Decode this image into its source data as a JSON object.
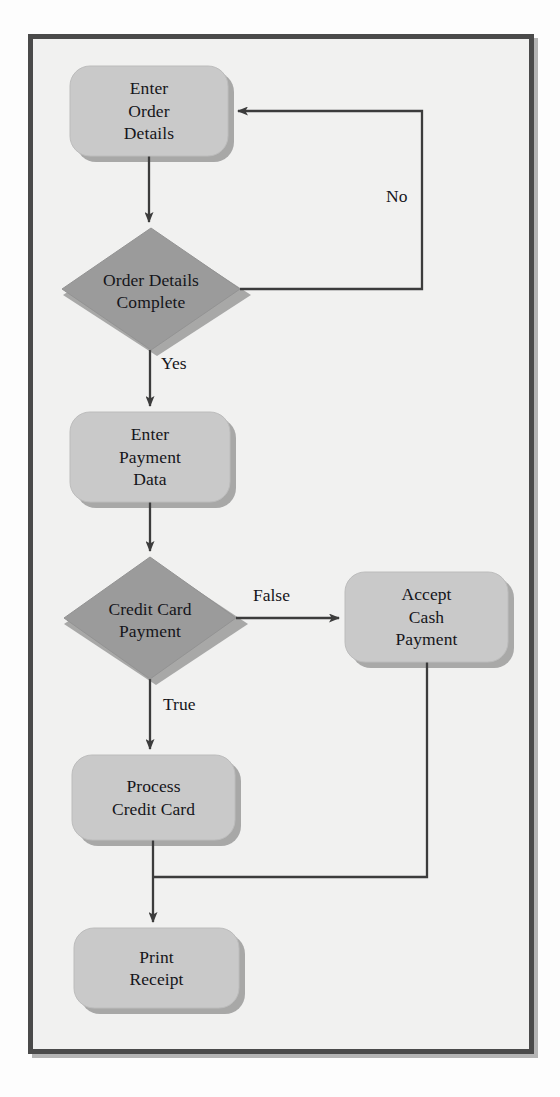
{
  "diagram": {
    "background_color": "#f1f1f0",
    "frame_border_color": "#4a4a4a",
    "process_fill": "#c9c9c9",
    "decision_fill": "#9b9b9b",
    "shadow_color": "#7c7c7c",
    "line_color": "#3c3c3c",
    "text_color": "#15151a"
  },
  "nodes": [
    {
      "id": "enter-order-details",
      "type": "process",
      "label": "Enter\nOrder\nDetails",
      "x": 70,
      "y": 66,
      "w": 158,
      "h": 90
    },
    {
      "id": "order-details-complete",
      "type": "decision",
      "label": "Order Details\nComplete",
      "x": 62,
      "y": 228,
      "w": 178,
      "h": 122
    },
    {
      "id": "enter-payment-data",
      "type": "process",
      "label": "Enter\nPayment\nData",
      "x": 70,
      "y": 412,
      "w": 160,
      "h": 90
    },
    {
      "id": "credit-card-payment",
      "type": "decision",
      "label": "Credit Card\nPayment",
      "x": 64,
      "y": 557,
      "w": 172,
      "h": 122
    },
    {
      "id": "accept-cash-payment",
      "type": "process",
      "label": "Accept\nCash\nPayment",
      "x": 345,
      "y": 572,
      "w": 163,
      "h": 90
    },
    {
      "id": "process-credit-card",
      "type": "process",
      "label": "Process\nCredit Card",
      "x": 72,
      "y": 755,
      "w": 163,
      "h": 85
    },
    {
      "id": "print-receipt",
      "type": "process",
      "label": "Print\nReceipt",
      "x": 74,
      "y": 928,
      "w": 165,
      "h": 80
    }
  ],
  "edge_labels": [
    {
      "id": "no-label",
      "text": "No",
      "x": 386,
      "y": 188
    },
    {
      "id": "yes-label",
      "text": "Yes",
      "x": 161,
      "y": 355
    },
    {
      "id": "false-label",
      "text": "False",
      "x": 253,
      "y": 587
    },
    {
      "id": "true-label",
      "text": "True",
      "x": 163,
      "y": 696
    }
  ],
  "edges": [
    {
      "id": "edge-order-to-decision",
      "from": "enter-order-details",
      "to": "order-details-complete",
      "label": ""
    },
    {
      "id": "edge-decision-no-loopback",
      "from": "order-details-complete",
      "to": "enter-order-details",
      "label": "No"
    },
    {
      "id": "edge-decision-yes-to-payment",
      "from": "order-details-complete",
      "to": "enter-payment-data",
      "label": "Yes"
    },
    {
      "id": "edge-payment-to-cc-decision",
      "from": "enter-payment-data",
      "to": "credit-card-payment",
      "label": ""
    },
    {
      "id": "edge-cc-false-to-cash",
      "from": "credit-card-payment",
      "to": "accept-cash-payment",
      "label": "False"
    },
    {
      "id": "edge-cc-true-to-process",
      "from": "credit-card-payment",
      "to": "process-credit-card",
      "label": "True"
    },
    {
      "id": "edge-cash-to-merge",
      "from": "accept-cash-payment",
      "to": "print-receipt",
      "label": ""
    },
    {
      "id": "edge-process-to-receipt",
      "from": "process-credit-card",
      "to": "print-receipt",
      "label": ""
    }
  ]
}
